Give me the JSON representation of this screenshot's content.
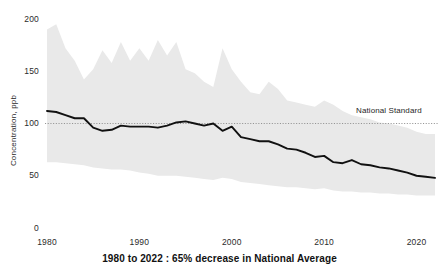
{
  "chart_data": {
    "type": "line",
    "title": "",
    "caption": "1980 to 2022 :  65% decrease in National Average",
    "xlabel": "",
    "ylabel": "Concentration, ppb",
    "xlim": [
      1980,
      2022
    ],
    "ylim": [
      0,
      200
    ],
    "grid": false,
    "legend_position": "none",
    "yticks": [
      0,
      50,
      100,
      150,
      200
    ],
    "ytick_labels": [
      "0",
      "50",
      "100",
      "150",
      "200"
    ],
    "xticks": [
      1980,
      1990,
      2000,
      2010,
      2020
    ],
    "xtick_labels": [
      "1980",
      "1990",
      "2000",
      "2010",
      "2020"
    ],
    "annotations": [
      {
        "name": "national-standard",
        "label": "National Standard",
        "value": 100,
        "style": "dotted-horizontal-line",
        "color": "#7a7a7a"
      }
    ],
    "x": [
      1980,
      1981,
      1982,
      1983,
      1984,
      1985,
      1986,
      1987,
      1988,
      1989,
      1990,
      1991,
      1992,
      1993,
      1994,
      1995,
      1996,
      1997,
      1998,
      1999,
      2000,
      2001,
      2002,
      2003,
      2004,
      2005,
      2006,
      2007,
      2008,
      2009,
      2010,
      2011,
      2012,
      2013,
      2014,
      2015,
      2016,
      2017,
      2018,
      2019,
      2020,
      2021,
      2022
    ],
    "series": [
      {
        "name": "National Average",
        "color": "#111111",
        "style": "solid-line",
        "values": [
          112,
          111,
          108,
          105,
          105,
          96,
          93,
          94,
          98,
          97,
          97,
          97,
          96,
          98,
          101,
          102,
          100,
          98,
          100,
          93,
          97,
          87,
          85,
          83,
          83,
          80,
          76,
          75,
          72,
          68,
          69,
          63,
          62,
          65,
          61,
          60,
          58,
          57,
          55,
          53,
          50,
          49,
          48
        ]
      },
      {
        "name": "90th Percentile (band upper)",
        "color": "#e8e8e8",
        "style": "band-upper",
        "values": [
          190,
          195,
          172,
          160,
          142,
          152,
          170,
          158,
          178,
          160,
          172,
          160,
          180,
          165,
          178,
          152,
          148,
          140,
          135,
          172,
          152,
          140,
          130,
          128,
          140,
          133,
          122,
          120,
          118,
          116,
          122,
          118,
          112,
          108,
          106,
          104,
          101,
          100,
          98,
          96,
          92,
          90,
          90
        ]
      },
      {
        "name": "10th Percentile (band lower)",
        "color": "#e8e8e8",
        "style": "band-lower",
        "values": [
          63,
          63,
          62,
          61,
          60,
          58,
          57,
          56,
          56,
          55,
          53,
          52,
          50,
          50,
          50,
          49,
          48,
          47,
          46,
          48,
          47,
          44,
          43,
          42,
          41,
          40,
          39,
          39,
          38,
          37,
          38,
          36,
          35,
          35,
          34,
          34,
          33,
          33,
          32,
          32,
          31,
          31,
          31
        ]
      }
    ]
  },
  "layout": {
    "plot_left": 47,
    "plot_right": 435,
    "plot_top": 19,
    "plot_bottom": 228,
    "background": "#ffffff",
    "band_color": "#e9e9e9",
    "line_color": "#111111",
    "standard_line_color": "#8a8a8a",
    "text_color": "#2b2b2b"
  }
}
